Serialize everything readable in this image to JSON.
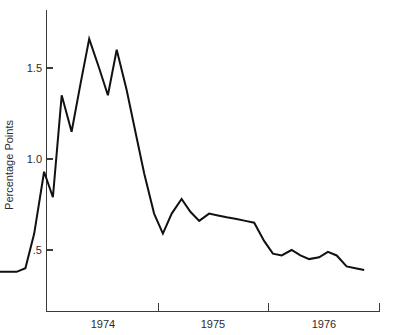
{
  "chart_data": {
    "type": "line",
    "title": "",
    "subtitle": "",
    "xlabel": "",
    "ylabel": "Percentage Points",
    "xlim": [
      1973.5,
      1976.95
    ],
    "ylim": [
      0.28,
      1.78
    ],
    "grid": false,
    "legend": null,
    "annotations": [],
    "y_ticks": [
      {
        "value": 1.5,
        "label": "1.5"
      },
      {
        "value": 1.0,
        "label": "1.0"
      },
      {
        "value": 0.5,
        "label": ".5"
      }
    ],
    "x_ticks": [
      {
        "value": 1975.0,
        "label": ""
      },
      {
        "value": 1976.0,
        "label": ""
      }
    ],
    "x_tick_labels": [
      {
        "value": 1974.5,
        "label": "1974"
      },
      {
        "value": 1975.5,
        "label": "1975"
      },
      {
        "value": 1976.5,
        "label": "1976"
      }
    ],
    "line_color": "#111111",
    "axis_color": "#3a3a3a",
    "background_color": "#ffffff",
    "series": [
      {
        "name": "Percentage Points",
        "x": [
          1973.54,
          1973.62,
          1973.71,
          1973.79,
          1973.87,
          1973.96,
          1974.04,
          1974.12,
          1974.21,
          1974.29,
          1974.37,
          1974.46,
          1974.54,
          1974.62,
          1974.71,
          1974.79,
          1974.87,
          1974.96,
          1975.04,
          1975.12,
          1975.21,
          1975.29,
          1975.37,
          1975.46,
          1975.54,
          1975.62,
          1975.71,
          1975.79,
          1975.87,
          1975.96,
          1976.04,
          1976.12,
          1976.21,
          1976.29,
          1976.37,
          1976.46,
          1976.54,
          1976.62,
          1976.71,
          1976.79,
          1976.87
        ],
        "y": [
          0.38,
          0.38,
          0.38,
          0.4,
          0.59,
          0.93,
          0.79,
          1.35,
          1.15,
          1.41,
          1.66,
          1.5,
          1.35,
          1.6,
          1.38,
          1.15,
          0.92,
          0.7,
          0.59,
          0.7,
          0.78,
          0.71,
          0.66,
          0.7,
          0.69,
          0.68,
          0.67,
          0.66,
          0.65,
          0.55,
          0.48,
          0.47,
          0.5,
          0.47,
          0.45,
          0.46,
          0.49,
          0.47,
          0.41,
          0.4,
          0.39
        ]
      }
    ]
  },
  "labels": {
    "y_axis_title": "Percentage Points",
    "y_tick_1": "1.5",
    "y_tick_2": "1.0",
    "y_tick_3": ".5",
    "x_label_1": "1974",
    "x_label_2": "1975",
    "x_label_3": "1976"
  }
}
